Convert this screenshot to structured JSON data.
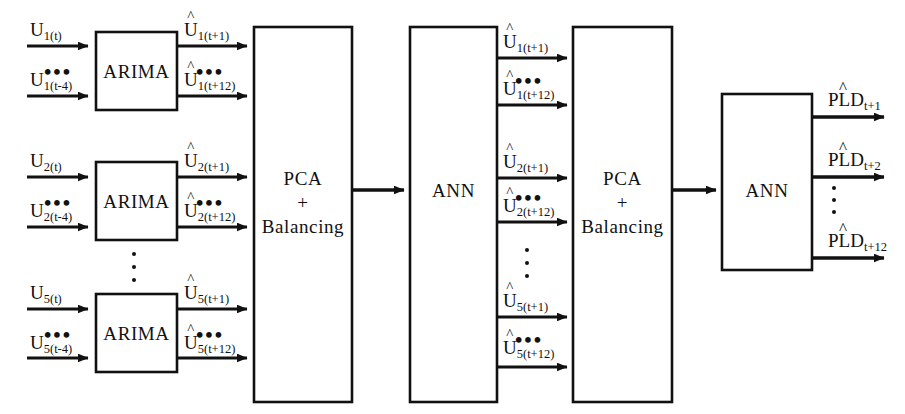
{
  "diagram": {
    "stroke_color": "#111111",
    "background_color": "#ffffff",
    "blocks": [
      {
        "id": "arima1",
        "label": "ARIMA"
      },
      {
        "id": "arima2",
        "label": "ARIMA"
      },
      {
        "id": "arima5",
        "label": "ARIMA"
      },
      {
        "id": "pca1",
        "label_line1": "PCA",
        "label_line2": "+",
        "label_line3": "Balancing"
      },
      {
        "id": "ann1",
        "label": "ANN"
      },
      {
        "id": "pca2",
        "label_line1": "PCA",
        "label_line2": "+",
        "label_line3": "Balancing"
      },
      {
        "id": "ann2",
        "label": "ANN"
      }
    ],
    "inputs": [
      {
        "id": "u1_t",
        "base": "U",
        "sub": "1(t)",
        "hat": false
      },
      {
        "id": "u1_t4",
        "base": "U",
        "sub": "1(t-4)",
        "hat": false
      },
      {
        "id": "u2_t",
        "base": "U",
        "sub": "2(t)",
        "hat": false
      },
      {
        "id": "u2_t4",
        "base": "U",
        "sub": "2(t-4)",
        "hat": false
      },
      {
        "id": "u5_t",
        "base": "U",
        "sub": "5(t)",
        "hat": false
      },
      {
        "id": "u5_t4",
        "base": "U",
        "sub": "5(t-4)",
        "hat": false
      }
    ],
    "arima_outputs": [
      {
        "id": "uh1_t1",
        "base": "U",
        "sub": "1(t+1)",
        "hat": true
      },
      {
        "id": "uh1_t12",
        "base": "U",
        "sub": "1(t+12)",
        "hat": true
      },
      {
        "id": "uh2_t1",
        "base": "U",
        "sub": "2(t+1)",
        "hat": true
      },
      {
        "id": "uh2_t12",
        "base": "U",
        "sub": "2(t+12)",
        "hat": true
      },
      {
        "id": "uh5_t1",
        "base": "U",
        "sub": "5(t+1)",
        "hat": true
      },
      {
        "id": "uh5_t12",
        "base": "U",
        "sub": "5(t+12)",
        "hat": true
      }
    ],
    "ann1_outputs": [
      {
        "id": "m_uh1_t1",
        "base": "U",
        "sub": "1(t+1)",
        "hat": true
      },
      {
        "id": "m_uh1_t12",
        "base": "U",
        "sub": "1(t+12)",
        "hat": true
      },
      {
        "id": "m_uh2_t1",
        "base": "U",
        "sub": "2(t+1)",
        "hat": true
      },
      {
        "id": "m_uh2_t12",
        "base": "U",
        "sub": "2(t+12)",
        "hat": true
      },
      {
        "id": "m_uh5_t1",
        "base": "U",
        "sub": "5(t+1)",
        "hat": true
      },
      {
        "id": "m_uh5_t12",
        "base": "U",
        "sub": "5(t+12)",
        "hat": true
      }
    ],
    "final_outputs": [
      {
        "id": "pld_t1",
        "base": "PLD",
        "sub": "t+1",
        "hat": true
      },
      {
        "id": "pld_t2",
        "base": "PLD",
        "sub": "t+2",
        "hat": true
      },
      {
        "id": "pld_t12",
        "base": "PLD",
        "sub": "t+12",
        "hat": true
      }
    ],
    "ellipsis_symbol": "•••",
    "hat_symbol": "^"
  }
}
